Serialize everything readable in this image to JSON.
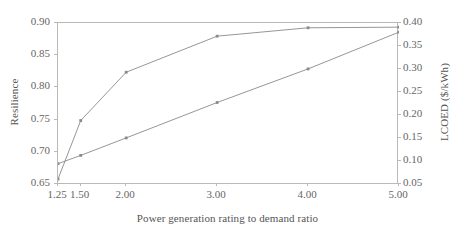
{
  "chart_data": {
    "type": "line",
    "title": "",
    "xlabel": "Power generation rating to demand ratio",
    "ylabel": "Resilience",
    "y2label": "LCOED ($/kWh)",
    "x": [
      1.25,
      1.5,
      2.0,
      3.0,
      4.0,
      5.0
    ],
    "xtick_labels": [
      "1.25",
      "1.50",
      "2.00",
      "3.00",
      "4.00",
      "5.00"
    ],
    "xlim": [
      1.25,
      5.0
    ],
    "ylim": [
      0.65,
      0.9
    ],
    "ytick_labels": [
      "0.65",
      "0.70",
      "0.75",
      "0.80",
      "0.85",
      "0.90"
    ],
    "ytick_values": [
      0.65,
      0.7,
      0.75,
      0.8,
      0.85,
      0.9
    ],
    "y2lim": [
      0.05,
      0.4
    ],
    "y2tick_labels": [
      "0.05",
      "0.10",
      "0.15",
      "0.20",
      "0.25",
      "0.30",
      "0.35",
      "0.40"
    ],
    "y2tick_values": [
      0.05,
      0.1,
      0.15,
      0.2,
      0.25,
      0.3,
      0.35,
      0.4
    ],
    "grid": false,
    "legend": "none",
    "line_color": "#8a8a8a",
    "marker_color": "#8a8a8a",
    "series": [
      {
        "name": "Resilience",
        "axis": "left",
        "values": [
          0.656,
          0.747,
          0.822,
          0.878,
          0.891,
          0.892
        ]
      },
      {
        "name": "LCOED ($/kWh)",
        "axis": "right",
        "values": [
          0.092,
          0.11,
          0.148,
          0.225,
          0.298,
          0.378
        ]
      }
    ]
  }
}
